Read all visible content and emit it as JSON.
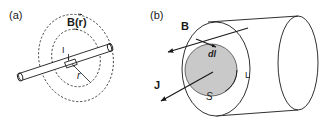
{
  "figure": {
    "background_color": "#ffffff",
    "ink_color": "#1a1a1a",
    "shade_color": "#c9c9c9",
    "width": 329,
    "height": 133
  },
  "panel_a": {
    "label": "(a)",
    "field_label": "B(r)",
    "current_label": "I",
    "radius_label": "r",
    "description": "Straight current-carrying wire with two concentric dashed magnetic field loops"
  },
  "panel_b": {
    "label": "(b)",
    "field_vector_label": "B",
    "current_density_label": "J",
    "line_element_label": "dl",
    "boundary_label": "L",
    "surface_label": "S",
    "description": "Cylindrical conductor showing open surface S bounded by loop L"
  }
}
